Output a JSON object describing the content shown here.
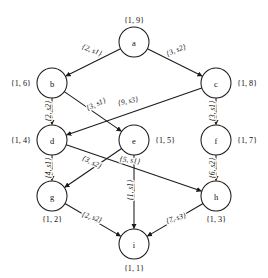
{
  "diagram": {
    "stroke_color": "#1a1a1a",
    "text_color": "#111111",
    "background": "#ffffff",
    "nodes": [
      {
        "id": "a",
        "label": "a",
        "weight": "{1, 9}",
        "cx": 134,
        "cy": 42,
        "r": 15,
        "weight_x": 134,
        "weight_y": 20,
        "weight_anchor": "middle"
      },
      {
        "id": "b",
        "label": "b",
        "weight": "{1, 6}",
        "cx": 52,
        "cy": 83,
        "r": 15,
        "weight_x": 31,
        "weight_y": 83,
        "weight_anchor": "end"
      },
      {
        "id": "c",
        "label": "c",
        "weight": "{1, 8}",
        "cx": 216,
        "cy": 83,
        "r": 15,
        "weight_x": 237,
        "weight_y": 83,
        "weight_anchor": "start"
      },
      {
        "id": "d",
        "label": "d",
        "weight": "{1, 4}",
        "cx": 52,
        "cy": 140,
        "r": 15,
        "weight_x": 31,
        "weight_y": 140,
        "weight_anchor": "end"
      },
      {
        "id": "e",
        "label": "e",
        "weight": "{1, 5}",
        "cx": 134,
        "cy": 140,
        "r": 15,
        "weight_x": 155,
        "weight_y": 140,
        "weight_anchor": "start"
      },
      {
        "id": "f",
        "label": "f",
        "weight": "{1, 7}",
        "cx": 216,
        "cy": 140,
        "r": 15,
        "weight_x": 237,
        "weight_y": 140,
        "weight_anchor": "start"
      },
      {
        "id": "g",
        "label": "g",
        "weight": "{1, 2}",
        "cx": 52,
        "cy": 196,
        "r": 15,
        "weight_x": 52,
        "weight_y": 219,
        "weight_anchor": "middle"
      },
      {
        "id": "h",
        "label": "h",
        "weight": "{1, 3}",
        "cx": 216,
        "cy": 196,
        "r": 15,
        "weight_x": 216,
        "weight_y": 219,
        "weight_anchor": "middle"
      },
      {
        "id": "i",
        "label": "i",
        "weight": "{1, 1}",
        "cx": 134,
        "cy": 244,
        "r": 15,
        "weight_x": 134,
        "weight_y": 268,
        "weight_anchor": "middle"
      }
    ],
    "edges": [
      {
        "id": "a-b",
        "from": "a",
        "to": "b",
        "weight": "{2, s1}",
        "label_x": 92,
        "label_y": 50,
        "label_rot": 22,
        "label_anchor": "middle"
      },
      {
        "id": "a-c",
        "from": "a",
        "to": "c",
        "weight": "{3, s2}",
        "label_x": 176,
        "label_y": 50,
        "label_rot": -22,
        "label_anchor": "middle"
      },
      {
        "id": "b-d",
        "from": "b",
        "to": "d",
        "weight": "{2, s2}",
        "label_x": 48,
        "label_y": 111,
        "label_rot": -90,
        "label_anchor": "middle"
      },
      {
        "id": "b-e",
        "from": "b",
        "to": "e",
        "weight": "{3, s1}",
        "label_x": 96,
        "label_y": 104,
        "label_rot": -24,
        "label_anchor": "middle"
      },
      {
        "id": "c-d",
        "from": "c",
        "to": "d",
        "weight": "{9, s3}",
        "label_x": 128,
        "label_y": 101,
        "label_rot": -12,
        "label_anchor": "middle"
      },
      {
        "id": "c-f",
        "from": "c",
        "to": "f",
        "weight": "{3, s1}",
        "label_x": 212,
        "label_y": 111,
        "label_rot": -90,
        "label_anchor": "middle"
      },
      {
        "id": "d-g",
        "from": "d",
        "to": "g",
        "weight": "{4, s1}",
        "label_x": 48,
        "label_y": 168,
        "label_rot": -90,
        "label_anchor": "middle"
      },
      {
        "id": "d-h",
        "from": "d",
        "to": "h",
        "weight": "{5, s1}",
        "label_x": 130,
        "label_y": 160,
        "label_rot": 8,
        "label_anchor": "middle"
      },
      {
        "id": "e-g",
        "from": "e",
        "to": "g",
        "weight": "{3, s2}",
        "label_x": 92,
        "label_y": 162,
        "label_rot": 26,
        "label_anchor": "middle"
      },
      {
        "id": "e-i",
        "from": "e",
        "to": "i",
        "weight": "{1, s1}",
        "label_x": 130,
        "label_y": 190,
        "label_rot": -90,
        "label_anchor": "middle"
      },
      {
        "id": "f-h",
        "from": "f",
        "to": "h",
        "weight": "{6, s2}",
        "label_x": 212,
        "label_y": 168,
        "label_rot": -90,
        "label_anchor": "middle"
      },
      {
        "id": "g-i",
        "from": "g",
        "to": "i",
        "weight": "{2, s2}",
        "label_x": 92,
        "label_y": 217,
        "label_rot": 17,
        "label_anchor": "middle"
      },
      {
        "id": "h-i",
        "from": "h",
        "to": "i",
        "weight": "{7, s3}",
        "label_x": 176,
        "label_y": 218,
        "label_rot": -17,
        "label_anchor": "middle"
      }
    ]
  }
}
